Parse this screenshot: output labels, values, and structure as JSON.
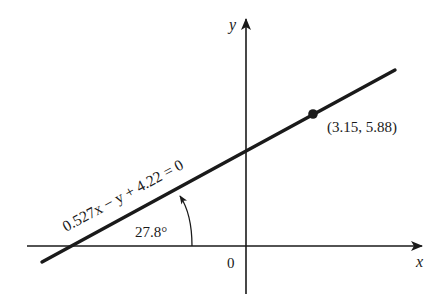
{
  "diagram": {
    "type": "coordinate-line-plot",
    "axes": {
      "x_label": "x",
      "y_label": "y",
      "origin_label": "0"
    },
    "line": {
      "equation": "0.527x − y + 4.22 = 0",
      "inclination_angle": "27.8°"
    },
    "point": {
      "label": "(3.15, 5.88)",
      "x": 3.15,
      "y": 5.88
    },
    "colors": {
      "stroke": "#1a1a1a",
      "background": "#ffffff"
    }
  }
}
